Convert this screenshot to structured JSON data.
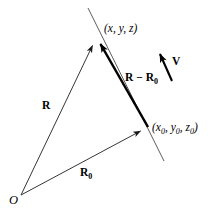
{
  "figure": {
    "type": "vector-diagram",
    "background_color": "#ffffff",
    "stroke_color": "#000000",
    "thin_stroke_color": "#3a3a3a",
    "width": 212,
    "height": 217,
    "labels": {
      "point_p": "(x, y, z)",
      "point_p0_open": "(x",
      "point_p0_sub0a": "0",
      "point_p0_mid1": ", y",
      "point_p0_sub0b": "0",
      "point_p0_mid2": ", z",
      "point_p0_sub0c": "0",
      "point_p0_close": ")",
      "vector_r": "R",
      "vector_r0_base": "R",
      "vector_r0_sub": "0",
      "vector_diff_a": "R",
      "vector_diff_minus": " − ",
      "vector_diff_b": "R",
      "vector_diff_sub": "0",
      "vector_v": "V",
      "origin": "O"
    },
    "geometry": {
      "origin_point": [
        20,
        196
      ],
      "point_p": [
        97,
        36
      ],
      "point_p0": [
        148,
        127
      ],
      "v_arrow_tail": [
        172,
        81
      ],
      "v_arrow_tip": [
        157,
        47
      ],
      "thin_line_top": [
        88,
        8
      ],
      "thin_line_bottom": [
        164,
        160
      ]
    }
  }
}
